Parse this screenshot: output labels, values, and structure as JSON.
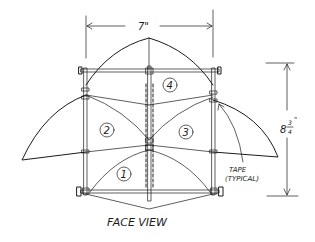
{
  "diagram": {
    "title": "FACE VIEW",
    "dimensions": {
      "width": "7\"",
      "height_whole": "8",
      "height_frac_num": "3",
      "height_frac_den": "4",
      "height_unit": "\""
    },
    "callout": {
      "line1": "TAPE",
      "line2": "(TYPICAL)"
    },
    "panels": [
      {
        "id": "panel-top",
        "label": "4"
      },
      {
        "id": "panel-left",
        "label": "2"
      },
      {
        "id": "panel-right",
        "label": "3"
      },
      {
        "id": "panel-bottom",
        "label": "1"
      }
    ]
  }
}
